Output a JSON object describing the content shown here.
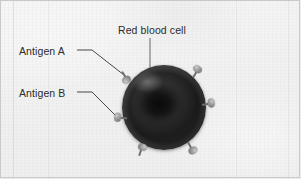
{
  "figure": {
    "background_color": "#f2f2f2",
    "border_color": "#c9c9c9",
    "text_color": "#2b2b2b"
  },
  "labels": {
    "red_blood_cell": "Red blood cell",
    "antigen_a": "Antigen A",
    "antigen_b": "Antigen B"
  },
  "cell": {
    "name": "red-blood-cell",
    "shape": "biconcave disc",
    "fill_color": "#1d1d1d",
    "rim_color": "#4a4a4a",
    "center_x": 164,
    "center_y": 108,
    "radius": 42
  },
  "antigens": [
    {
      "id": "antigen-marker-1",
      "angle": -122,
      "x": 123,
      "y": 73,
      "group": "A"
    },
    {
      "id": "antigen-marker-2",
      "angle": -58,
      "x": 196,
      "y": 71,
      "group": "A"
    },
    {
      "id": "antigen-marker-3",
      "angle": -10,
      "x": 208,
      "y": 103,
      "group": "A"
    },
    {
      "id": "antigen-marker-4",
      "angle": 178,
      "x": 117,
      "y": 117,
      "group": "B"
    },
    {
      "id": "antigen-marker-5",
      "angle": 108,
      "x": 138,
      "y": 150,
      "group": "B"
    },
    {
      "id": "antigen-marker-6",
      "angle": 62,
      "x": 188,
      "y": 148,
      "group": "B"
    }
  ],
  "leaders": [
    {
      "id": "leader-red-blood-cell",
      "from_x": 150,
      "from_y": 38,
      "to_x": 150,
      "to_y": 85
    },
    {
      "id": "leader-antigen-a",
      "from_x": 77,
      "from_y": 50,
      "to_x": 124,
      "to_y": 75
    },
    {
      "id": "leader-antigen-b",
      "from_x": 77,
      "from_y": 92,
      "to_x": 119,
      "to_y": 119
    }
  ]
}
